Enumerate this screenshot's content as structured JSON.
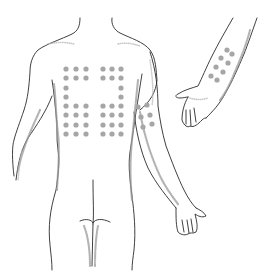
{
  "figure": {
    "background": "#ffffff",
    "outline_color": "#2a2a2a",
    "dot_color": "#a6a6a6",
    "dot_radius": 2.6
  },
  "back_test_sites": {
    "left_block": {
      "columns_x": [
        66,
        76,
        86
      ],
      "rows": [
        {
          "y": 69,
          "cols": [
            0,
            1,
            2
          ]
        },
        {
          "y": 78,
          "cols": [
            0,
            1,
            2
          ]
        },
        {
          "y": 88,
          "cols": [
            0
          ]
        },
        {
          "y": 97,
          "cols": [
            0
          ]
        },
        {
          "y": 106,
          "cols": [
            0,
            1,
            2
          ]
        },
        {
          "y": 115,
          "cols": [
            0,
            1,
            2
          ]
        },
        {
          "y": 125,
          "cols": [
            0,
            1,
            2
          ]
        },
        {
          "y": 134,
          "cols": [
            0,
            1,
            2
          ]
        }
      ]
    },
    "right_block": {
      "columns_x": [
        103,
        112,
        121
      ],
      "rows": [
        {
          "y": 69,
          "cols": [
            0,
            1,
            2
          ]
        },
        {
          "y": 78,
          "cols": [
            0,
            1,
            2
          ]
        },
        {
          "y": 88,
          "cols": [
            2
          ]
        },
        {
          "y": 97,
          "cols": [
            2
          ]
        },
        {
          "y": 106,
          "cols": [
            0,
            1,
            2
          ]
        },
        {
          "y": 115,
          "cols": [
            0,
            1,
            2
          ]
        },
        {
          "y": 125,
          "cols": [
            0,
            1,
            2
          ]
        },
        {
          "y": 134,
          "cols": [
            0,
            1,
            2
          ]
        }
      ]
    }
  },
  "upper_arm_test_sites": [
    {
      "x": 138,
      "y": 107
    },
    {
      "x": 147,
      "y": 105
    },
    {
      "x": 141,
      "y": 117
    },
    {
      "x": 150,
      "y": 115
    },
    {
      "x": 143,
      "y": 127
    },
    {
      "x": 152,
      "y": 124
    }
  ],
  "forearm_test_sites": [
    {
      "x": 227,
      "y": 50
    },
    {
      "x": 232,
      "y": 54
    },
    {
      "x": 221,
      "y": 58
    },
    {
      "x": 228,
      "y": 63
    },
    {
      "x": 216,
      "y": 67
    },
    {
      "x": 223,
      "y": 72
    },
    {
      "x": 211,
      "y": 76
    },
    {
      "x": 217,
      "y": 80
    }
  ]
}
